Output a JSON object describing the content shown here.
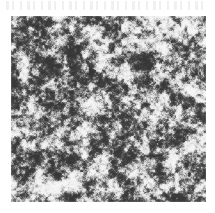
{
  "page": {
    "background_color": "#ffffff",
    "width": 215,
    "height": 213,
    "caption": ""
  },
  "artifacts": {
    "bleed_through_band": {
      "name": "scanner-bleed-through",
      "visible": true,
      "text": "",
      "legible": false
    }
  },
  "figure": {
    "type": "micrograph",
    "label": "",
    "title": "",
    "scale_bar_text": "",
    "frame": {
      "x": 11,
      "y": 16,
      "width": 195,
      "height": 186
    },
    "appearance": {
      "palette": "grayscale",
      "darkest_color": "#101010",
      "midtone_color": "#8f8f8f",
      "lightest_color": "#f2f2f2",
      "mean_level": 150,
      "contrast": "high",
      "grain": "fine speckled granular",
      "description": "Dense high-contrast speckle texture with irregular dark clusters"
    },
    "regions": [
      {
        "name": "upper-left",
        "tone": "darker",
        "mean_level": 128
      },
      {
        "name": "upper-right",
        "tone": "lighter",
        "mean_level": 163
      },
      {
        "name": "center",
        "tone": "mid",
        "mean_level": 150
      },
      {
        "name": "lower-center",
        "tone": "coarse dark blobs",
        "mean_level": 132
      },
      {
        "name": "lower-right",
        "tone": "mid-light",
        "mean_level": 158
      }
    ]
  }
}
